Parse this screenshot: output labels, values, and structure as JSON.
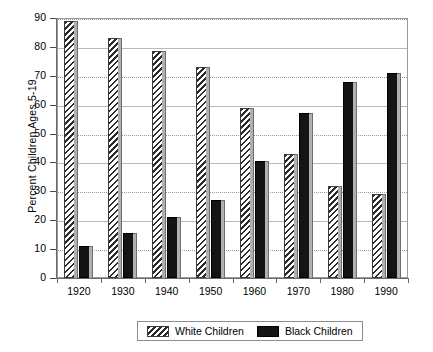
{
  "chart_data": {
    "type": "bar",
    "title": "",
    "subtitle": "",
    "xlabel": "",
    "ylabel": "Percent Children Ages 5-19",
    "categories": [
      "1920",
      "1930",
      "1940",
      "1950",
      "1960",
      "1970",
      "1980",
      "1990"
    ],
    "series": [
      {
        "name": "White Children",
        "pattern": "diagonal-hatch",
        "color": "#ffffff",
        "values": [
          89,
          83,
          78.5,
          73,
          59,
          43,
          32,
          29
        ]
      },
      {
        "name": "Black Children",
        "pattern": "solid",
        "color": "#141414",
        "values": [
          11,
          15.5,
          21,
          27,
          40.5,
          57,
          68,
          71
        ]
      }
    ],
    "ylim": [
      0,
      90
    ],
    "yticks": [
      0,
      10,
      20,
      30,
      40,
      50,
      60,
      70,
      80,
      90
    ],
    "ytick_labels": [
      "0",
      "10",
      "20",
      "30",
      "40",
      "50",
      "60",
      "70",
      "80",
      "90"
    ],
    "grid": true,
    "grid_axis": "y",
    "legend_position": "bottom-center",
    "legend_entries": [
      "White Children",
      "Black Children"
    ]
  },
  "legend": {
    "items": [
      {
        "label": "White Children",
        "swatch": "hatched-swatch"
      },
      {
        "label": "Black Children",
        "swatch": "solid-black-swatch"
      }
    ]
  },
  "axes": {
    "y_title": "Percent Children Ages 5-19"
  }
}
